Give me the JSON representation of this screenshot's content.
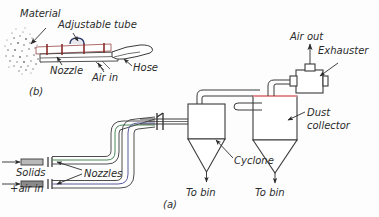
{
  "figure": {
    "background_color": "#fdfdfd",
    "line_color": "#3a3a3a",
    "accent_colors": {
      "nozzle_body": "#d9a0a0",
      "nozzle_marks": "#8a2b2b",
      "collector_top": "#e58e8e",
      "pipe_green": "#4a8a5a",
      "pipe_blue": "#5a5aa0"
    },
    "panels": [
      {
        "id": "b",
        "caption": "(b)",
        "description": "Nozzle / adjustable tube detail"
      },
      {
        "id": "a",
        "caption": "(a)",
        "description": "Conveying system flow diagram"
      }
    ]
  },
  "panel_b": {
    "caption": "(b)",
    "labels": {
      "material": "Material",
      "adjustable_tube": "Adjustable tube",
      "nozzle": "Nozzle",
      "air_in": "Air in",
      "hose": "Hose"
    }
  },
  "panel_a": {
    "caption": "(a)",
    "labels": {
      "solids": "Solids",
      "air_in": "+air in",
      "nozzles": "Nozzles",
      "cyclone": "Cyclone",
      "to_bin_cyclone": "To bin",
      "to_bin_collector": "To bin",
      "dust_collector_line1": "Dust",
      "dust_collector_line2": "collector",
      "air_out": "Air out",
      "exhauster": "Exhauster"
    }
  }
}
